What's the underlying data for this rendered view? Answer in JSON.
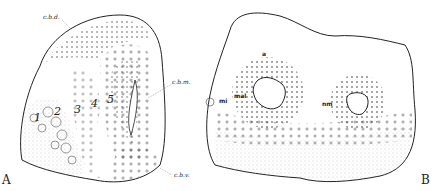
{
  "figure": {
    "panel_a": {
      "letter": "A",
      "labels": {
        "cbd": "c.b.d.",
        "cbm": "c.b.m.",
        "cbv": "c.b.v."
      },
      "numbers": [
        "1",
        "2",
        "3",
        "4",
        "5"
      ]
    },
    "panel_b": {
      "letter": "B",
      "labels": {
        "a": "a",
        "mal": "mal",
        "mi": "mi",
        "nm": "nm"
      }
    },
    "colors": {
      "ink": "#222222",
      "background": "#ffffff"
    }
  }
}
